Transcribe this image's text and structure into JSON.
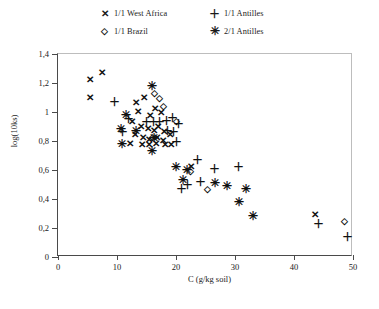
{
  "legend": {
    "entries": [
      {
        "marker": "cross-marker",
        "glyph": "✕",
        "label": "1/1 West Africa"
      },
      {
        "marker": "plus-marker",
        "glyph": "＋",
        "label": "1/1 Antilles"
      },
      {
        "marker": "diamond-marker",
        "glyph": "◇",
        "label": "1/1 Brazil"
      },
      {
        "marker": "star-marker",
        "glyph": "✳",
        "label": "2/1 Antilles"
      }
    ]
  },
  "axes": {
    "x_title": "C (g/kg soil)",
    "y_title": "log(10ks)",
    "x_ticks": [
      "0",
      "10",
      "20",
      "30",
      "40",
      "50"
    ],
    "y_ticks": [
      "0",
      "0,2",
      "0,4",
      "0,6",
      "0,8",
      "1",
      "1,2",
      "1,4"
    ]
  },
  "chart_data": {
    "type": "scatter",
    "title": "",
    "xlabel": "C (g/kg soil)",
    "ylabel": "log(10ks)",
    "xlim": [
      0,
      50
    ],
    "ylim": [
      0,
      1.4
    ],
    "xticks": [
      0,
      10,
      20,
      30,
      40,
      50
    ],
    "yticks": [
      0,
      0.2,
      0.4,
      0.6,
      0.8,
      1.0,
      1.2,
      1.4
    ],
    "grid": false,
    "legend_position": "top-center-outside",
    "series": [
      {
        "name": "1/1 West Africa",
        "marker": "x",
        "points": [
          [
            5.5,
            1.22
          ],
          [
            7.5,
            1.27
          ],
          [
            5.5,
            1.1
          ],
          [
            13.2,
            1.06
          ],
          [
            14.6,
            1.1
          ],
          [
            13.6,
            1.0
          ],
          [
            15.6,
            0.97
          ],
          [
            16.4,
            1.02
          ],
          [
            17.4,
            0.99
          ],
          [
            12.6,
            0.93
          ],
          [
            14.0,
            0.9
          ],
          [
            15.3,
            0.88
          ],
          [
            16.2,
            0.87
          ],
          [
            17.0,
            0.9
          ],
          [
            18.0,
            0.86
          ],
          [
            13.0,
            0.84
          ],
          [
            14.4,
            0.82
          ],
          [
            15.5,
            0.81
          ],
          [
            16.8,
            0.82
          ],
          [
            17.8,
            0.8
          ],
          [
            19.0,
            0.84
          ],
          [
            12.2,
            0.78
          ],
          [
            14.2,
            0.77
          ],
          [
            15.4,
            0.77
          ],
          [
            16.6,
            0.78
          ],
          [
            18.2,
            0.77
          ],
          [
            19.2,
            0.77
          ],
          [
            22.6,
            0.62
          ],
          [
            43.5,
            0.29
          ]
        ]
      },
      {
        "name": "1/1 Antilles",
        "marker": "+",
        "points": [
          [
            9.6,
            1.07
          ],
          [
            12.0,
            0.95
          ],
          [
            11.0,
            0.86
          ],
          [
            15.0,
            0.93
          ],
          [
            16.2,
            0.93
          ],
          [
            17.2,
            0.93
          ],
          [
            18.4,
            0.94
          ],
          [
            19.4,
            0.96
          ],
          [
            18.6,
            0.87
          ],
          [
            19.6,
            0.86
          ],
          [
            20.4,
            0.92
          ],
          [
            20.0,
            0.79
          ],
          [
            23.6,
            0.67
          ],
          [
            26.6,
            0.61
          ],
          [
            30.6,
            0.62
          ],
          [
            22.0,
            0.5
          ],
          [
            24.2,
            0.52
          ],
          [
            21.0,
            0.47
          ],
          [
            44.2,
            0.23
          ],
          [
            49.0,
            0.14
          ]
        ]
      },
      {
        "name": "1/1 Brazil",
        "marker": "diamond",
        "points": [
          [
            16.4,
            1.13
          ],
          [
            17.2,
            1.1
          ],
          [
            17.8,
            1.04
          ],
          [
            16.0,
            0.83
          ],
          [
            20.0,
            0.94
          ],
          [
            22.4,
            0.59
          ],
          [
            25.4,
            0.47
          ],
          [
            48.5,
            0.25
          ]
        ]
      },
      {
        "name": "2/1 Antilles",
        "marker": "star",
        "points": [
          [
            16.0,
            1.18
          ],
          [
            11.6,
            0.98
          ],
          [
            10.6,
            0.88
          ],
          [
            13.2,
            0.87
          ],
          [
            16.2,
            0.82
          ],
          [
            10.8,
            0.78
          ],
          [
            16.0,
            0.73
          ],
          [
            20.0,
            0.62
          ],
          [
            21.8,
            0.6
          ],
          [
            21.2,
            0.53
          ],
          [
            26.6,
            0.51
          ],
          [
            28.6,
            0.49
          ],
          [
            31.8,
            0.47
          ],
          [
            33.0,
            0.28
          ],
          [
            30.6,
            0.38
          ]
        ]
      }
    ]
  }
}
